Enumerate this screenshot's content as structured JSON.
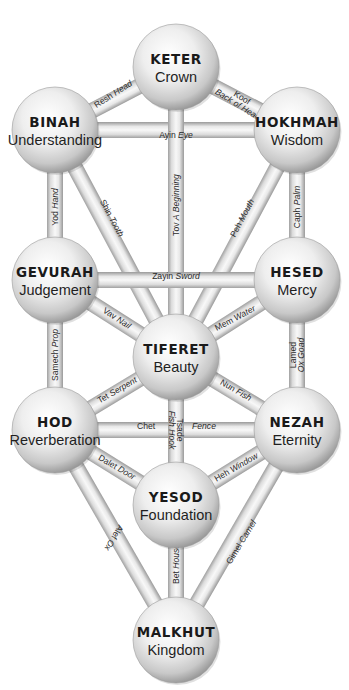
{
  "diagram": {
    "colors": {
      "background": "#ffffff",
      "sphere_light": "#ffffff",
      "sphere_mid": "#d8d8d8",
      "sphere_dark": "#8a8a8a",
      "path_light": "#f2f2f2",
      "path_dark": "#9a9a9a",
      "text": "#1a1a1a"
    },
    "sphere_radius": 43,
    "path_width": 16,
    "spheres": [
      {
        "id": "keter",
        "name": "KETER",
        "meaning": "Crown",
        "cx": 176,
        "cy": 67
      },
      {
        "id": "binah",
        "name": "BINAH",
        "meaning": "Understanding",
        "cx": 55,
        "cy": 130
      },
      {
        "id": "hokhmah",
        "name": "HOKHMAH",
        "meaning": "Wisdom",
        "cx": 297,
        "cy": 130
      },
      {
        "id": "gevurah",
        "name": "GEVURAH",
        "meaning": "Judgement",
        "cx": 55,
        "cy": 280
      },
      {
        "id": "hesed",
        "name": "HESED",
        "meaning": "Mercy",
        "cx": 297,
        "cy": 280
      },
      {
        "id": "tiferet",
        "name": "TIFERET",
        "meaning": "Beauty",
        "cx": 176,
        "cy": 357
      },
      {
        "id": "hod",
        "name": "HOD",
        "meaning": "Reverberation",
        "cx": 55,
        "cy": 430
      },
      {
        "id": "nezah",
        "name": "NEZAH",
        "meaning": "Eternity",
        "cx": 297,
        "cy": 430
      },
      {
        "id": "yesod",
        "name": "YESOD",
        "meaning": "Foundation",
        "cx": 176,
        "cy": 505
      },
      {
        "id": "malkhut",
        "name": "MALKHUT",
        "meaning": "Kingdom",
        "cx": 176,
        "cy": 640
      }
    ],
    "paths": [
      {
        "from": "keter",
        "to": "binah",
        "letter": "Resh",
        "meaning": "Head",
        "lx": 113,
        "ly": 94,
        "rot": -33
      },
      {
        "from": "keter",
        "to": "hokhmah",
        "letter": "Koof",
        "meaning": "Back of Head",
        "lx": 240,
        "ly": 101,
        "rot": 32,
        "stacked": true
      },
      {
        "from": "binah",
        "to": "hokhmah",
        "letter": "Ayin",
        "meaning": "Eye",
        "lx": 176,
        "ly": 135,
        "rot": 0
      },
      {
        "from": "keter",
        "to": "tiferet",
        "letter": "Tov",
        "meaning": "A Beginning",
        "lx": 176,
        "ly": 205,
        "rot": -90
      },
      {
        "from": "binah",
        "to": "gevurah",
        "letter": "Yod",
        "meaning": "Hand",
        "lx": 55,
        "ly": 207,
        "rot": -90
      },
      {
        "from": "hokhmah",
        "to": "hesed",
        "letter": "Caph",
        "meaning": "Palm",
        "lx": 297,
        "ly": 207,
        "rot": -90
      },
      {
        "from": "binah",
        "to": "tiferet",
        "letter": "Shin",
        "meaning": "Tooth",
        "lx": 112,
        "ly": 218,
        "rot": 62
      },
      {
        "from": "hokhmah",
        "to": "tiferet",
        "letter": "Peh",
        "meaning": "Mouth",
        "lx": 242,
        "ly": 218,
        "rot": -62
      },
      {
        "from": "gevurah",
        "to": "hesed",
        "letter": "Zayin",
        "meaning": "Sword",
        "lx": 176,
        "ly": 276,
        "rot": 0
      },
      {
        "from": "gevurah",
        "to": "tiferet",
        "letter": "Vav",
        "meaning": "Nail",
        "lx": 117,
        "ly": 318,
        "rot": 33
      },
      {
        "from": "hesed",
        "to": "tiferet",
        "letter": "Mem",
        "meaning": "Water",
        "lx": 235,
        "ly": 318,
        "rot": -28
      },
      {
        "from": "gevurah",
        "to": "hod",
        "letter": "Samech",
        "meaning": "Prop",
        "lx": 55,
        "ly": 355,
        "rot": -90
      },
      {
        "from": "hesed",
        "to": "nezah",
        "letter": "Lamed",
        "meaning": "Ox Goad",
        "lx": 297,
        "ly": 355,
        "rot": -90,
        "stacked": true
      },
      {
        "from": "tiferet",
        "to": "hod",
        "letter": "Tet",
        "meaning": "Serpent",
        "lx": 117,
        "ly": 390,
        "rot": -30
      },
      {
        "from": "tiferet",
        "to": "nezah",
        "letter": "Nun",
        "meaning": "Fish",
        "lx": 236,
        "ly": 390,
        "rot": 30
      },
      {
        "from": "hod",
        "to": "nezah",
        "letter": "Chet",
        "meaning": "Fence",
        "lx": 146,
        "ly": 426,
        "rot": 0,
        "split": 204
      },
      {
        "from": "tiferet",
        "to": "yesod",
        "letter": "Tsade",
        "meaning": "Fish Hook",
        "lx": 176,
        "ly": 430,
        "rot": 90,
        "stacked": true
      },
      {
        "from": "hod",
        "to": "yesod",
        "letter": "Dalet",
        "meaning": "Door",
        "lx": 117,
        "ly": 467,
        "rot": 30
      },
      {
        "from": "nezah",
        "to": "yesod",
        "letter": "Heh",
        "meaning": "Window",
        "lx": 236,
        "ly": 467,
        "rot": -30
      },
      {
        "from": "hod",
        "to": "malkhut",
        "letter": "Alef",
        "meaning": "Ox",
        "lx": 114,
        "ly": 538,
        "rot": 121
      },
      {
        "from": "yesod",
        "to": "malkhut",
        "letter": "Bet",
        "meaning": "House",
        "lx": 176,
        "ly": 564,
        "rot": -90
      },
      {
        "from": "nezah",
        "to": "malkhut",
        "letter": "Gimel",
        "meaning": "Camel",
        "lx": 241,
        "ly": 542,
        "rot": -59
      }
    ]
  }
}
